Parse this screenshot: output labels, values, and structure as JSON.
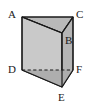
{
  "figure": {
    "name": "triangular-prism",
    "shape_type": "triangular prism",
    "background_color": "#ffffff",
    "stroke_color": "#1a1a1a",
    "label_color": "#1a1a1a",
    "faces": {
      "top_face_color": "#b9b9b9",
      "left_front_face_color": "#c9c9c9",
      "right_front_face_color": "#bdbdbd",
      "bottom_left_face_color": "#b4b4b4",
      "bottom_right_face_color": "#a8a8a8"
    },
    "vertices": [
      {
        "label": "A",
        "x": 22,
        "y": 17,
        "label_x": 8,
        "label_y": 9,
        "hidden": false
      },
      {
        "label": "B",
        "x": 62,
        "y": 33,
        "label_x": 65,
        "label_y": 35,
        "hidden": false
      },
      {
        "label": "C",
        "x": 73,
        "y": 17,
        "label_x": 76,
        "label_y": 9,
        "hidden": false
      },
      {
        "label": "D",
        "x": 22,
        "y": 70,
        "label_x": 8,
        "label_y": 64,
        "hidden": false
      },
      {
        "label": "E",
        "x": 62,
        "y": 87,
        "label_x": 58,
        "label_y": 92,
        "hidden": false
      },
      {
        "label": "F",
        "x": 73,
        "y": 70,
        "label_x": 76,
        "label_y": 64,
        "hidden": false
      }
    ],
    "edges": [
      {
        "name": "A-C",
        "from": "A",
        "to": "C",
        "style": "solid"
      },
      {
        "name": "A-B",
        "from": "A",
        "to": "B",
        "style": "solid"
      },
      {
        "name": "B-C",
        "from": "B",
        "to": "C",
        "style": "solid"
      },
      {
        "name": "A-D",
        "from": "A",
        "to": "D",
        "style": "solid"
      },
      {
        "name": "C-F",
        "from": "C",
        "to": "F",
        "style": "solid"
      },
      {
        "name": "B-E",
        "from": "B",
        "to": "E",
        "style": "solid"
      },
      {
        "name": "D-E",
        "from": "D",
        "to": "E",
        "style": "solid"
      },
      {
        "name": "E-F",
        "from": "E",
        "to": "F",
        "style": "solid"
      },
      {
        "name": "D-F",
        "from": "D",
        "to": "F",
        "style": "dashed"
      }
    ]
  }
}
